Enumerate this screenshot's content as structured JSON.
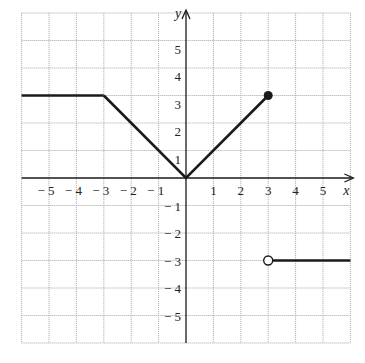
{
  "chart_data": {
    "type": "line",
    "title": "",
    "xlabel": "x",
    "ylabel": "y",
    "xlim": [
      -6,
      6
    ],
    "ylim": [
      -6,
      6
    ],
    "grid": true,
    "x_ticks": [
      "-5",
      "-4",
      "-3",
      "-2",
      "-1",
      "1",
      "2",
      "3",
      "4",
      "5"
    ],
    "y_ticks": [
      "5",
      "4",
      "3",
      "2",
      "1",
      "-1",
      "-2",
      "-3",
      "-4",
      "-5"
    ],
    "series": [
      {
        "name": "piece-1 constant",
        "x": [
          -6,
          -3
        ],
        "y": [
          3,
          3
        ],
        "style": "solid"
      },
      {
        "name": "piece-2 |x|",
        "x": [
          -3,
          0,
          3
        ],
        "y": [
          3,
          0,
          3
        ],
        "style": "solid",
        "end_point": {
          "x": 3,
          "y": 3,
          "marker": "closed"
        }
      },
      {
        "name": "piece-3 constant",
        "x": [
          3,
          6
        ],
        "y": [
          -3,
          -3
        ],
        "style": "solid",
        "start_point": {
          "x": 3,
          "y": -3,
          "marker": "open"
        }
      }
    ],
    "colors": {
      "line": "#1a1a1a",
      "grid": "#b5b5b5",
      "axis": "#1a1a1a"
    }
  }
}
